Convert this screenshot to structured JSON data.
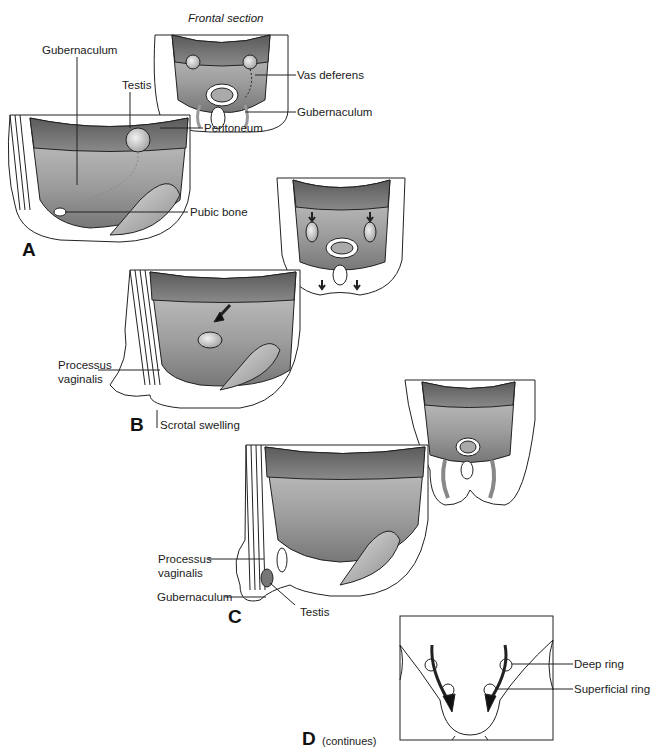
{
  "figure": {
    "title": "Frontal section",
    "continues_note": "(continues)",
    "panels": [
      {
        "id": "A",
        "letter": "A",
        "labels": [
          "Gubernaculum",
          "Testis",
          "Peritoneum",
          "Pubic bone"
        ],
        "frontal_labels": [
          "Vas deferens",
          "Gubernaculum"
        ]
      },
      {
        "id": "B",
        "letter": "B",
        "labels": [
          "Processus vaginalis",
          "Scrotal swelling"
        ]
      },
      {
        "id": "C",
        "letter": "C",
        "labels": [
          "Processus vaginalis",
          "Gubernaculum",
          "Testis"
        ]
      },
      {
        "id": "D",
        "letter": "D",
        "labels": [
          "Deep ring",
          "Superficial ring"
        ]
      }
    ]
  },
  "labels": {
    "frontal_section": "Frontal section",
    "a_vas_deferens": "Vas deferens",
    "a_gubernaculum_frontal": "Gubernaculum",
    "a_gubernaculum": "Gubernaculum",
    "a_testis": "Testis",
    "a_peritoneum": "Peritoneum",
    "a_pubic_bone": "Pubic bone",
    "b_processus_line1": "Processus",
    "b_processus_line2": "vaginalis",
    "b_scrotal_swelling": "Scrotal swelling",
    "c_processus_line1": "Processus",
    "c_processus_line2": "vaginalis",
    "c_gubernaculum": "Gubernaculum",
    "c_testis": "Testis",
    "d_deep_ring": "Deep ring",
    "d_superficial_ring": "Superficial ring",
    "panel_a": "A",
    "panel_b": "B",
    "panel_c": "C",
    "panel_d": "D",
    "continues": "(continues)"
  }
}
